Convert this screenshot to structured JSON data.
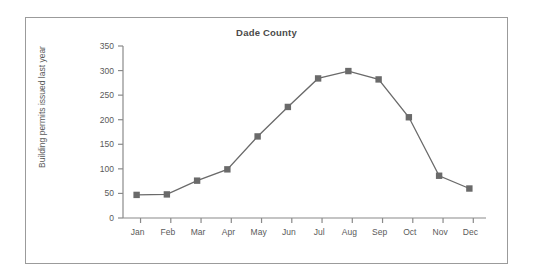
{
  "chart_data": {
    "type": "line",
    "title": "Dade County",
    "xlabel": "",
    "ylabel": "Building permits issued last year",
    "categories": [
      "Jan",
      "Feb",
      "Mar",
      "Apr",
      "May",
      "Jun",
      "Jul",
      "Aug",
      "Sep",
      "Oct",
      "Nov",
      "Dec"
    ],
    "values": [
      47,
      48,
      76,
      99,
      166,
      226,
      284,
      299,
      282,
      205,
      86,
      60
    ],
    "series": [
      {
        "name": "Building permits issued last year",
        "values": [
          47,
          48,
          76,
          99,
          166,
          226,
          284,
          299,
          282,
          205,
          86,
          60
        ]
      }
    ],
    "ylim": [
      0,
      350
    ],
    "yticks": [
      0,
      50,
      100,
      150,
      200,
      250,
      300,
      350
    ],
    "ytick_labels": [
      "0",
      "50",
      "100",
      "150",
      "200",
      "250",
      "300",
      "350"
    ],
    "grid": false,
    "legend": false,
    "marker": "square",
    "line_color": "#6a6a6a",
    "marker_color": "#6a6a6a",
    "axis_color": "#8a8a8a",
    "text_color": "#5a5a5a",
    "frame_color": "#9b9b9b",
    "background": "#ffffff"
  }
}
